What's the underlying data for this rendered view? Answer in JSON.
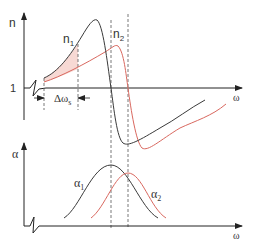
{
  "colors": {
    "axis": "#222222",
    "n1_curve": "#3a3a3a",
    "n2_curve": "#d9685f",
    "shade": "#f7d9d4",
    "dashed": "#555555"
  },
  "top_plot": {
    "y_axis_label": "n",
    "y_tick_label": "1",
    "x_axis_label": "ω",
    "curve1_label": "n",
    "curve1_sub": "1",
    "curve2_label": "n",
    "curve2_sub": "2",
    "bandwidth_label": "Δω",
    "bandwidth_sub": "s"
  },
  "bottom_plot": {
    "y_axis_label": "α",
    "x_axis_label": "ω",
    "curve1_label": "α",
    "curve1_sub": "1",
    "curve2_label": "α",
    "curve2_sub": "2"
  }
}
